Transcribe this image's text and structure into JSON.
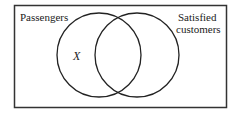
{
  "diagram": {
    "type": "venn",
    "universe_label": "Passengers",
    "sets": [
      {
        "name": "left-circle",
        "label": ""
      },
      {
        "name": "right-circle",
        "label": "Satisfied customers"
      }
    ],
    "labels": {
      "universe": "Passengers",
      "right_set_line1": "Satisfied",
      "right_set_line2": "customers",
      "region_marker": "X"
    },
    "colors": {
      "stroke": "#222222",
      "background": "#ffffff"
    }
  }
}
